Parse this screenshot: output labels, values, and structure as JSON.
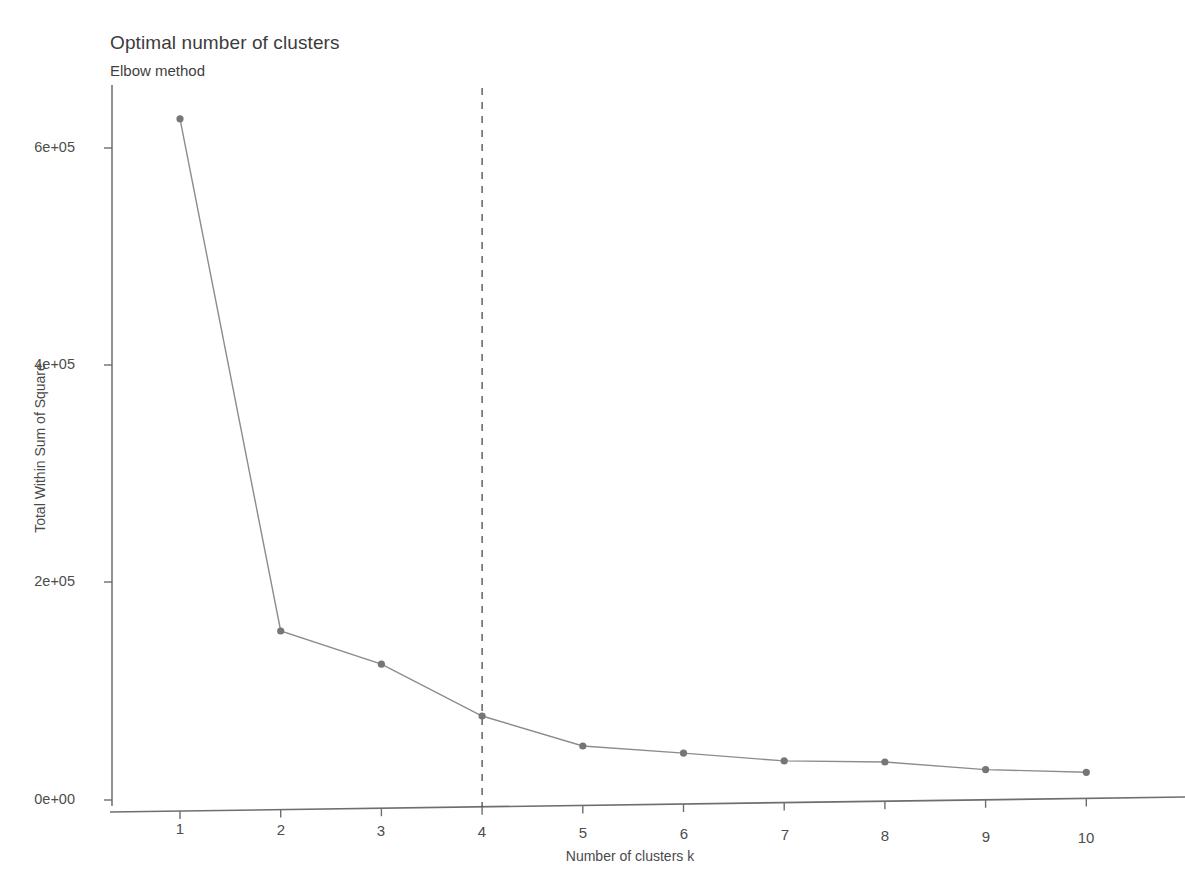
{
  "chart_data": {
    "type": "line",
    "title": "Optimal number of clusters",
    "subtitle": "Elbow method",
    "xlabel": "Number of clusters k",
    "ylabel": "Total Within Sum of Square",
    "x": [
      1,
      2,
      3,
      4,
      5,
      6,
      7,
      8,
      9,
      10
    ],
    "categories": [
      "1",
      "2",
      "3",
      "4",
      "5",
      "6",
      "7",
      "8",
      "9",
      "10"
    ],
    "values": [
      627000,
      155500,
      125000,
      77300,
      49700,
      43200,
      36000,
      35000,
      28000,
      25500
    ],
    "series": [
      {
        "name": "Total within sum of square",
        "values": [
          627000,
          155500,
          125000,
          77300,
          49700,
          43200,
          36000,
          35000,
          28000,
          25500
        ]
      }
    ],
    "xlim": [
      0.6,
      10.4
    ],
    "ylim": [
      0,
      640000
    ],
    "xticks": [
      1,
      2,
      3,
      4,
      5,
      6,
      7,
      8,
      9,
      10
    ],
    "xtick_labels": [
      "1",
      "2",
      "3",
      "4",
      "5",
      "6",
      "7",
      "8",
      "9",
      "10"
    ],
    "yticks": [
      0,
      200000,
      400000,
      600000
    ],
    "ytick_labels": [
      "0e+00",
      "2e+05",
      "4e+05",
      "6e+05"
    ],
    "grid": false,
    "legend": "none",
    "line_color": "#8c8c8c",
    "marker_color": "#767676",
    "axis_color": "#6e6e6e",
    "background": "#ffffff",
    "annotations": [
      {
        "type": "vline",
        "name": "optimal-k-dashed-line",
        "x": 4,
        "style": "dashed",
        "color": "#4a4a4a"
      }
    ]
  }
}
